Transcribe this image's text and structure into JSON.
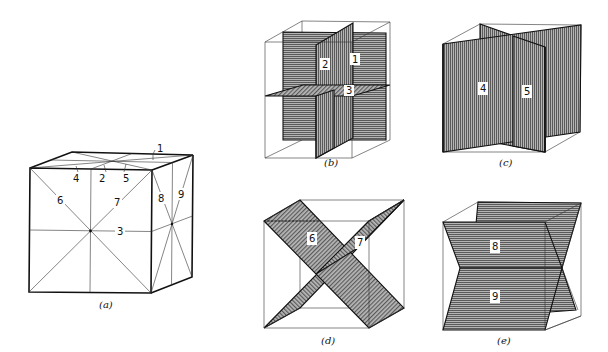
{
  "figure": {
    "panels": [
      {
        "id": "a",
        "caption": "(a)",
        "labels": [
          "1",
          "2",
          "3",
          "4",
          "5",
          "6",
          "7",
          "8",
          "9"
        ]
      },
      {
        "id": "b",
        "caption": "(b)",
        "labels": [
          "1",
          "2",
          "3"
        ]
      },
      {
        "id": "c",
        "caption": "(c)",
        "labels": [
          "4",
          "5"
        ]
      },
      {
        "id": "d",
        "caption": "(d)",
        "labels": [
          "6",
          "7"
        ]
      },
      {
        "id": "e",
        "caption": "(e)",
        "labels": [
          "8",
          "9"
        ]
      }
    ]
  },
  "colors": {
    "line": "#222222",
    "plane_fill": "#8c8c8c",
    "background": "#ffffff"
  }
}
